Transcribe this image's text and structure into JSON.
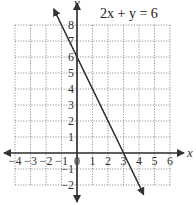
{
  "chart_data": {
    "type": "line",
    "title": "2x + y = 6",
    "xlabel": "x",
    "ylabel": "y",
    "xlim": [
      -4,
      6
    ],
    "ylim": [
      -2,
      8
    ],
    "grid": true,
    "x_ticks": [
      "-4",
      "-3",
      "-2",
      "-1",
      "0",
      "1",
      "2",
      "3",
      "4",
      "5",
      "6"
    ],
    "y_ticks": [
      "-2",
      "-1",
      "1",
      "2",
      "3",
      "4",
      "5",
      "6",
      "7",
      "8"
    ],
    "series": [
      {
        "name": "2x + y = 6",
        "equation": "y = -2x + 6",
        "x": [
          -1.5,
          4.3
        ],
        "y": [
          9,
          -2.6
        ],
        "intercepts": {
          "x": 3,
          "y": 6
        }
      }
    ]
  },
  "labels": {
    "title": "2x + y = 6",
    "x_axis": "x",
    "y_axis": "y"
  }
}
